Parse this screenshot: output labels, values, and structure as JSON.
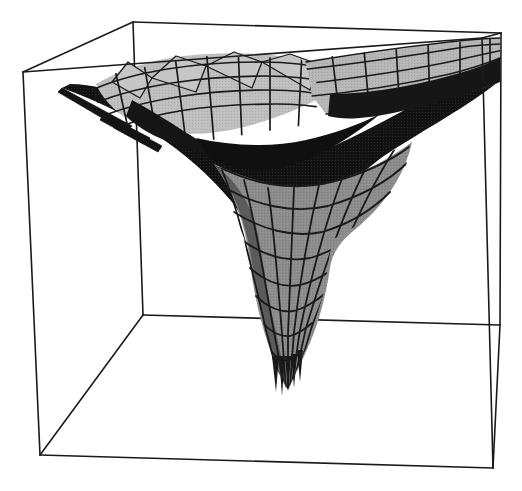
{
  "figure": {
    "title": "",
    "background_color": "#ffffff",
    "width": 522,
    "height": 491,
    "kind": "3d-surface-plot"
  },
  "chart_data": {
    "type": "surface3d",
    "title": "",
    "subtitle": "",
    "xlabel": "",
    "ylabel": "",
    "zlabel": "",
    "grid": false,
    "legend": "none",
    "tick_labels": {
      "x": [],
      "y": [],
      "z": []
    },
    "axis_ranges": {
      "xlim": [
        -1,
        1
      ],
      "ylim": [
        -1,
        1
      ],
      "zlim": [
        -1,
        1
      ]
    },
    "shading": {
      "palette": [
        "#d2d2d2",
        "#b9b9b9",
        "#9e9e9e",
        "#8a8a8a",
        "#6e6e6e",
        "#4a4a4a",
        "#2b2b2b",
        "#141414"
      ],
      "mesh_line_color": "#1a1a1a",
      "box_line_color": "#1a1a1a"
    },
    "surface_faces": [
      {
        "name": "wing-left-upper",
        "tone": "#c4c4c4",
        "points": "118,74 160,64 196,72 210,92 170,104 130,96"
      },
      {
        "name": "wing-left-upper-2",
        "tone": "#bdbdbd",
        "points": "160,64 200,58 236,66 248,88 210,92 196,72"
      },
      {
        "name": "wing-left-upper-3",
        "tone": "#c9c9c9",
        "points": "200,58 242,56 276,62 286,84 248,88 236,66"
      },
      {
        "name": "wing-mid-upper",
        "tone": "#c2c2c2",
        "points": "242,56 286,58 318,66 326,88 286,84 276,62"
      },
      {
        "name": "wing-right-upper",
        "tone": "#bcbcbc",
        "points": "300,62 346,56 392,50 430,46 452,62 404,72 356,80 320,86"
      },
      {
        "name": "wing-right-upper-2",
        "tone": "#b4b4b4",
        "points": "392,50 440,44 486,40 498,56 456,66 410,74"
      },
      {
        "name": "wing-right-lower",
        "tone": "#a9a9a9",
        "points": "404,72 456,66 498,56 496,80 448,92 398,100"
      },
      {
        "name": "valley-left",
        "tone": "#9b9b9b",
        "points": "130,96 170,104 210,92 248,88 286,84 300,120 250,136 196,140 150,126"
      },
      {
        "name": "underside-left",
        "tone": "#1b1b1b",
        "points": "70,92 130,96 150,126 196,140 230,170 180,170 122,134"
      },
      {
        "name": "underside-center",
        "tone": "#131313",
        "points": "196,140 250,136 300,120 326,150 290,190 236,196 210,166"
      },
      {
        "name": "underside-right",
        "tone": "#171717",
        "points": "326,88 398,100 448,92 496,80 470,120 404,146 344,150"
      },
      {
        "name": "funnel-upper-left",
        "tone": "#6b6b6b",
        "points": "230,170 290,190 300,230 248,240 212,206"
      },
      {
        "name": "funnel-upper-right",
        "tone": "#7e7e7e",
        "points": "290,190 344,150 404,146 396,198 330,236 300,230"
      },
      {
        "name": "funnel-mid",
        "tone": "#8c8c8c",
        "points": "248,240 300,230 330,236 326,286 284,304 252,288"
      },
      {
        "name": "funnel-lower",
        "tone": "#7a7a7a",
        "points": "252,288 284,304 326,286 312,338 282,352 262,330"
      },
      {
        "name": "funnel-tip",
        "tone": "#454545",
        "points": "262,330 282,352 312,338 300,378 286,388 272,366"
      },
      {
        "name": "spike-left",
        "tone": "#121212",
        "points": "62,88 120,116 134,128 104,120"
      }
    ],
    "mesh": {
      "u_lines": 14,
      "v_lines": 14,
      "visible": true
    },
    "bounding_box": {
      "front_bottom_left": [
        40,
        455
      ],
      "front_bottom_right": [
        493,
        468
      ],
      "front_top_left": [
        23,
        72
      ],
      "front_top_right": [
        482,
        38
      ],
      "back_bottom_left": [
        143,
        315
      ],
      "back_bottom_right": [
        500,
        325
      ],
      "back_top_left": [
        133,
        22
      ],
      "back_top_right": [
        501,
        33
      ]
    }
  },
  "annotations": []
}
